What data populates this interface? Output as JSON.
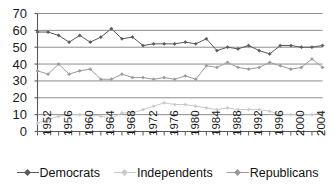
{
  "chart_data": {
    "type": "line",
    "title": "",
    "xlabel": "",
    "ylabel": "",
    "ylim": [
      0,
      70
    ],
    "ytick_step": 10,
    "grid": true,
    "grid_axis": "y",
    "legend_position": "bottom",
    "ytick_labels": [
      "70",
      "60",
      "50",
      "40",
      "30",
      "20",
      "10",
      "0"
    ],
    "ytick_values": [
      70,
      60,
      50,
      40,
      30,
      20,
      10,
      0
    ],
    "x": [
      1952,
      1954,
      1956,
      1958,
      1960,
      1962,
      1964,
      1966,
      1968,
      1970,
      1972,
      1974,
      1976,
      1978,
      1980,
      1982,
      1984,
      1986,
      1988,
      1990,
      1992,
      1994,
      1996,
      1998,
      2000,
      2002,
      2004,
      2006
    ],
    "xtick_labels": [
      "1952",
      "1956",
      "1960",
      "1964",
      "1968",
      "1972",
      "1976",
      "1980",
      "1984",
      "1988",
      "1992",
      "1996",
      "2000",
      "2004"
    ],
    "xtick_label_values": [
      1952,
      1956,
      1960,
      1964,
      1968,
      1972,
      1976,
      1980,
      1984,
      1988,
      1992,
      1996,
      2000,
      2004
    ],
    "series": [
      {
        "name": "Democrats",
        "color": "#595959",
        "marker": "diamond",
        "values": [
          59,
          59,
          57,
          53,
          57,
          53,
          56,
          61,
          55,
          56,
          51,
          52,
          52,
          52,
          53,
          52,
          55,
          48,
          50,
          49,
          51,
          48,
          46,
          51,
          51,
          50,
          50,
          51
        ]
      },
      {
        "name": "Independents",
        "color": "#c9c9c9",
        "marker": "diamond",
        "values": [
          5,
          7,
          9,
          10,
          10,
          10,
          9,
          8,
          11,
          11,
          13,
          15,
          17,
          16,
          16,
          15,
          14,
          13,
          14,
          13,
          13,
          13,
          12,
          10,
          10,
          10,
          10,
          11
        ]
      },
      {
        "name": "Republicans",
        "color": "#9a9a9a",
        "marker": "diamond",
        "values": [
          36,
          34,
          40,
          34,
          36,
          37,
          31,
          31,
          34,
          32,
          32,
          31,
          32,
          31,
          33,
          31,
          39,
          38,
          41,
          38,
          37,
          38,
          41,
          39,
          37,
          38,
          43,
          38
        ]
      }
    ]
  },
  "legend": {
    "entries": [
      {
        "label": "Democrats"
      },
      {
        "label": "Independents"
      },
      {
        "label": "Republicans"
      }
    ]
  }
}
